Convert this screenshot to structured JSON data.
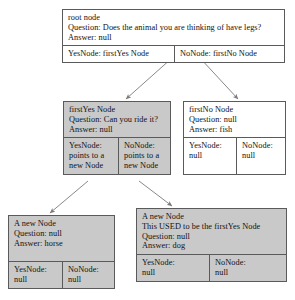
{
  "diagram": {
    "colors": {
      "shaded_fill": "#c9c9c9",
      "plain_fill": "#ffffff",
      "stroke": "#5a5a5a",
      "text": "#111111",
      "edge": "#7a7a7a"
    },
    "nodes": [
      {
        "id": "root-node",
        "shaded": false,
        "head": [
          "root node",
          "Question: Does the animal you are thinking of have legs?",
          "Answer: null"
        ],
        "ports": [
          {
            "name": "yes-port",
            "lines": [
              "YesNode: firstYes Node"
            ]
          },
          {
            "name": "no-port",
            "lines": [
              "NoNode: firstNo Node"
            ]
          }
        ]
      },
      {
        "id": "first-yes-node",
        "shaded": true,
        "head": [
          "firstYes Node",
          "Question: Can you ride it?",
          "Answer: null"
        ],
        "ports": [
          {
            "name": "yes-port",
            "lines": [
              "YesNode:",
              "points to a",
              "new Node"
            ]
          },
          {
            "name": "no-port",
            "lines": [
              "NoNode:",
              "points to a",
              "new Node"
            ]
          }
        ]
      },
      {
        "id": "first-no-node",
        "shaded": false,
        "head": [
          "firstNo Node",
          "Question: null",
          "Answer: fish"
        ],
        "ports": [
          {
            "name": "yes-port",
            "lines": [
              "YesNode:",
              "null"
            ]
          },
          {
            "name": "no-port",
            "lines": [
              "NoNode:",
              "null"
            ]
          }
        ]
      },
      {
        "id": "new-node-horse",
        "shaded": true,
        "head": [
          "A new Node",
          "Question: null",
          "Answer: horse"
        ],
        "ports": [
          {
            "name": "yes-port",
            "lines": [
              "YesNode:",
              "null"
            ]
          },
          {
            "name": "no-port",
            "lines": [
              "NoNode:",
              "null"
            ]
          }
        ]
      },
      {
        "id": "new-node-dog",
        "shaded": true,
        "head": [
          "A new Node",
          "This USED to be the firstYes Node",
          "Question: null",
          "Answer: dog"
        ],
        "ports": [
          {
            "name": "yes-port",
            "lines": [
              "YesNode:",
              "null"
            ]
          },
          {
            "name": "no-port",
            "lines": [
              "NoNode:",
              "null"
            ]
          }
        ]
      }
    ],
    "edges": [
      {
        "name": "edge-root-yes-to-first-yes",
        "from": "root-node.yes-port",
        "to": "first-yes-node"
      },
      {
        "name": "edge-root-no-to-first-no",
        "from": "root-node.no-port",
        "to": "first-no-node"
      },
      {
        "name": "edge-first-yes-yes-to-horse",
        "from": "first-yes-node.yes-port",
        "to": "new-node-horse"
      },
      {
        "name": "edge-first-yes-no-to-dog",
        "from": "first-yes-node.no-port",
        "to": "new-node-dog"
      }
    ]
  }
}
